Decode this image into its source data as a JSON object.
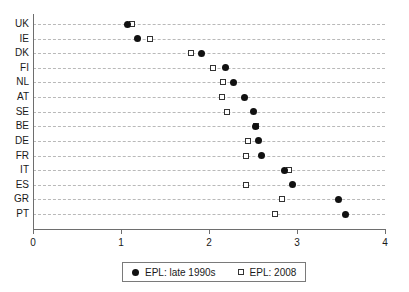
{
  "chart_data": {
    "type": "scatter",
    "title": "",
    "subtitle": "",
    "xlabel": "",
    "ylabel": "",
    "xlim": [
      0,
      4
    ],
    "xticks": [
      "0",
      "1",
      "2",
      "3",
      "4"
    ],
    "grid": true,
    "orientation": "horizontal",
    "legend_position": "bottom",
    "categories": [
      "UK",
      "IE",
      "DK",
      "FI",
      "NL",
      "AT",
      "SE",
      "BE",
      "DE",
      "FR",
      "IT",
      "ES",
      "GR",
      "PT"
    ],
    "series": [
      {
        "name": "EPL: late 1990s",
        "marker": "filled-circle",
        "color": "#111111",
        "values": [
          1.07,
          1.19,
          1.91,
          2.19,
          2.28,
          2.4,
          2.5,
          2.53,
          2.56,
          2.6,
          2.86,
          2.95,
          3.47,
          3.55
        ]
      },
      {
        "name": "EPL: 2008",
        "marker": "open-square",
        "color": "#333333",
        "values": [
          1.12,
          1.33,
          1.8,
          2.05,
          2.16,
          2.15,
          2.2,
          2.53,
          2.44,
          2.42,
          2.91,
          2.42,
          2.83,
          2.75
        ]
      }
    ]
  },
  "legend": {
    "entries": [
      {
        "label": "EPL: late 1990s"
      },
      {
        "label": "EPL: 2008"
      }
    ]
  }
}
